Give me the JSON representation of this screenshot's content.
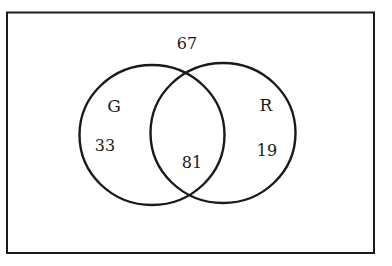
{
  "diagram": {
    "type": "venn",
    "universe": {
      "label": "",
      "outside_value": "67"
    },
    "sets": [
      {
        "name": "G",
        "only_value": "33"
      },
      {
        "name": "R",
        "only_value": "19"
      }
    ],
    "intersection": {
      "sets": [
        "G",
        "R"
      ],
      "value": "81"
    },
    "colors": {
      "stroke": "#1a1a1a",
      "background": "#ffffff"
    }
  }
}
